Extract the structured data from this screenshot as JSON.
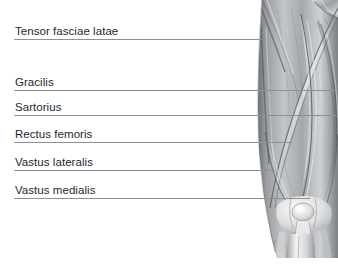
{
  "figure": {
    "background_color": "#ffffff",
    "label_color": "#25282b",
    "leader_line_color": "#8d9195",
    "image_name": "anterior-thigh-muscle-anatomy"
  },
  "callouts": [
    {
      "label": "Tensor fasciae latae",
      "name": "tensor-fasciae-latae",
      "line_y": 40,
      "line_end_x": 262
    },
    {
      "label": "Gracilis",
      "name": "gracilis",
      "line_y": 91,
      "line_end_x": 338
    },
    {
      "label": "Sartorius",
      "name": "sartorius",
      "line_y": 116,
      "line_end_x": 338
    },
    {
      "label": "Rectus femoris",
      "name": "rectus-femoris",
      "line_y": 143,
      "line_end_x": 292
    },
    {
      "label": "Vastus lateralis",
      "name": "vastus-lateralis",
      "line_y": 171,
      "line_end_x": 275
    },
    {
      "label": "Vastus medialis",
      "name": "vastus-medialis",
      "line_y": 199,
      "line_end_x": 310
    }
  ]
}
